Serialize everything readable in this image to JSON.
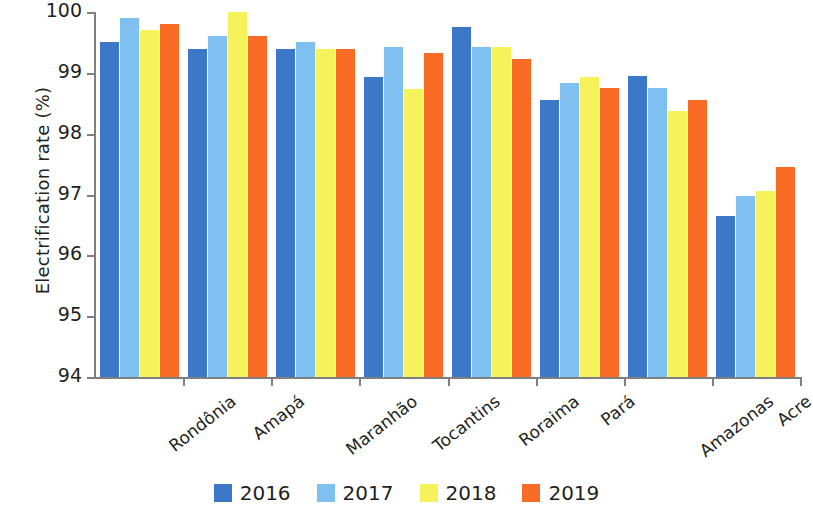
{
  "chart_data": {
    "type": "bar",
    "title": "",
    "subtitle": "",
    "xlabel": "",
    "ylabel": "Electrification rate (%)",
    "ylim": [
      94,
      100
    ],
    "yticks": [
      94,
      95,
      96,
      97,
      98,
      99,
      100
    ],
    "ytick_labels": [
      "94",
      "95",
      "96",
      "97",
      "98",
      "99",
      "100"
    ],
    "grid": false,
    "legend_position": "bottom",
    "categories": [
      "Rondônia",
      "Amapá",
      "Maranhão",
      "Tocantins",
      "Roraima",
      "Pará",
      "Amazonas",
      "Acre"
    ],
    "series": [
      {
        "name": "2016",
        "color": "#3d78c8",
        "values": [
          99.5,
          99.4,
          99.4,
          98.93,
          99.75,
          98.55,
          98.95,
          96.65
        ]
      },
      {
        "name": "2017",
        "color": "#7fc0f0",
        "values": [
          99.9,
          99.6,
          99.5,
          99.43,
          99.43,
          98.84,
          98.75,
          96.97
        ]
      },
      {
        "name": "2018",
        "color": "#f6f25c",
        "values": [
          99.7,
          100.0,
          99.4,
          98.73,
          99.43,
          98.93,
          98.37,
          97.05
        ]
      },
      {
        "name": "2019",
        "color": "#f96c26",
        "values": [
          99.8,
          99.6,
          99.4,
          99.33,
          99.23,
          98.75,
          98.55,
          97.45
        ]
      }
    ]
  },
  "legend": {
    "items": [
      {
        "label": "2016"
      },
      {
        "label": "2017"
      },
      {
        "label": "2018"
      },
      {
        "label": "2019"
      }
    ]
  }
}
